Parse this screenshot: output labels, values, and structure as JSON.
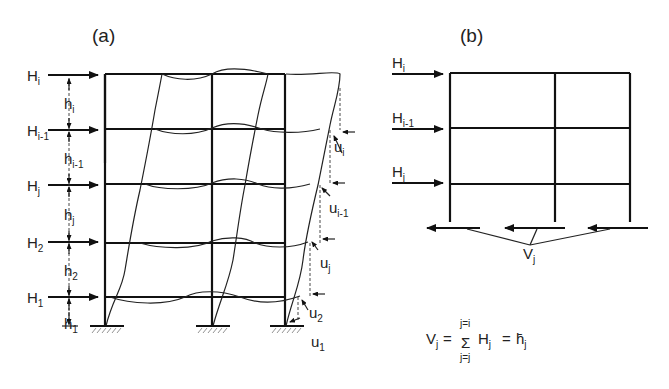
{
  "panel_a": {
    "title": "(a)",
    "loads": [
      {
        "main": "H",
        "sub": "i"
      },
      {
        "main": "H",
        "sub": "i-1"
      },
      {
        "main": "H",
        "sub": "j"
      },
      {
        "main": "H",
        "sub": "2"
      },
      {
        "main": "H",
        "sub": "1"
      }
    ],
    "heights": [
      {
        "main": "h",
        "sub": "i"
      },
      {
        "main": "h",
        "sub": "i-1"
      },
      {
        "main": "h",
        "sub": "j"
      },
      {
        "main": "h",
        "sub": "2"
      },
      {
        "main": "h",
        "sub": "1"
      }
    ],
    "displacements": [
      {
        "main": "u",
        "sub": "i"
      },
      {
        "main": "u",
        "sub": "i-1"
      },
      {
        "main": "u",
        "sub": "j"
      },
      {
        "main": "u",
        "sub": "2"
      },
      {
        "main": "u",
        "sub": "1"
      }
    ]
  },
  "panel_b": {
    "title": "(b)",
    "loads": [
      {
        "main": "H",
        "sub": "i"
      },
      {
        "main": "H",
        "sub": "i-1"
      },
      {
        "main": "H",
        "sub": "j"
      }
    ],
    "shear": {
      "main": "V",
      "sub": "j"
    }
  },
  "formula": {
    "lhs_main": "V",
    "lhs_sub": "j",
    "eq1": "=",
    "sigma": "Σ",
    "upper": "j=i",
    "lower": "j=j",
    "term_main": "H",
    "term_sub": "j",
    "eq2": "=",
    "rhs_main": "h̄",
    "rhs_sub": "j"
  }
}
